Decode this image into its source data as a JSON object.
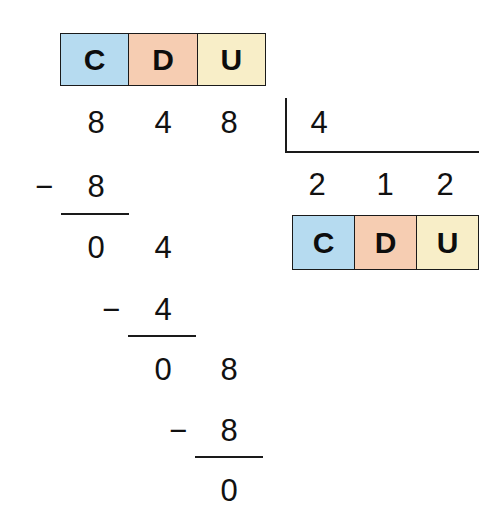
{
  "problem": {
    "dividend": "848",
    "divisor": "4",
    "quotient": "212",
    "remainder": "0"
  },
  "place_value_header_top": {
    "cells": [
      {
        "label": "C",
        "color": "#b6dbf0"
      },
      {
        "label": "D",
        "color": "#f6cdb2"
      },
      {
        "label": "U",
        "color": "#f8eec8"
      }
    ]
  },
  "place_value_header_bottom": {
    "cells": [
      {
        "label": "C",
        "color": "#b6dbf0"
      },
      {
        "label": "D",
        "color": "#f6cdb2"
      },
      {
        "label": "U",
        "color": "#f8eec8"
      }
    ]
  },
  "dividend_row": {
    "hundreds": "8",
    "tens": "4",
    "units": "8"
  },
  "divisor_box": {
    "value": "4"
  },
  "quotient_row": {
    "hundreds": "2",
    "tens": "1",
    "units": "2"
  },
  "step1": {
    "minus": "−",
    "subtrahend": "8",
    "result_hundreds": "0",
    "result_tens": "4"
  },
  "step2": {
    "minus": "−",
    "subtrahend": "4",
    "result_tens": "0",
    "result_units": "8"
  },
  "step3": {
    "minus": "−",
    "subtrahend": "8",
    "result_units": "0"
  },
  "colors": {
    "hundreds": "#b6dbf0",
    "tens": "#f6cdb2",
    "units": "#f8eec8",
    "ink": "#111111",
    "background": "#ffffff"
  }
}
